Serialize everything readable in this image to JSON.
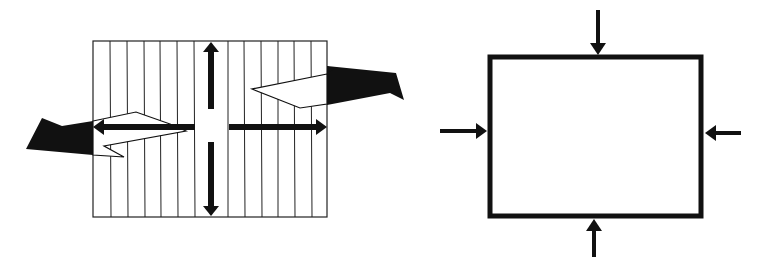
{
  "diagram": {
    "colors": {
      "ink": "#111111",
      "background": "#ffffff",
      "grid": "#222222"
    },
    "left_panel": {
      "name": "striped-panel-tension",
      "grid": {
        "x": 93,
        "y": 41,
        "width": 234,
        "height": 176,
        "line_xs": [
          110,
          127,
          144,
          160,
          177,
          194,
          228,
          244,
          261,
          278,
          294,
          311
        ]
      },
      "arrows": [
        {
          "name": "arrow-up",
          "direction": "up"
        },
        {
          "name": "arrow-down",
          "direction": "down"
        },
        {
          "name": "arrow-left",
          "direction": "left"
        },
        {
          "name": "arrow-right",
          "direction": "right"
        }
      ],
      "flags": [
        {
          "name": "flag-left",
          "side": "left"
        },
        {
          "name": "flag-right",
          "side": "right"
        }
      ]
    },
    "right_panel": {
      "name": "box-compression",
      "rect": {
        "x": 489,
        "y": 56,
        "width": 213,
        "height": 160
      },
      "arrows": [
        {
          "name": "arrow-from-top",
          "direction": "down"
        },
        {
          "name": "arrow-from-bottom",
          "direction": "up"
        },
        {
          "name": "arrow-from-left",
          "direction": "right"
        },
        {
          "name": "arrow-from-right",
          "direction": "left"
        }
      ]
    }
  }
}
